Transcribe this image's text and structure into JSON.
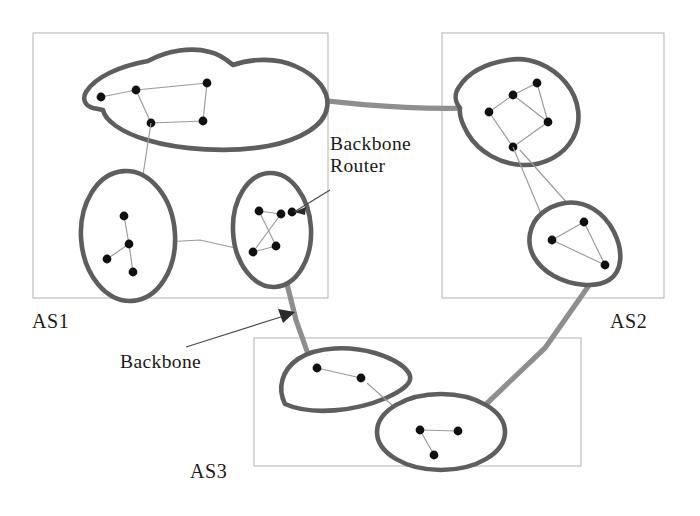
{
  "figure": {
    "background": "#ffffff",
    "width": 700,
    "height": 516
  },
  "colors": {
    "blob_outline": "#5e5e5e",
    "backbone_link": "#8e8e8e",
    "internal_link": "#9a9a9a",
    "router_node": "#101010",
    "as_box_border": "#b9b9b9",
    "leader_line": "#4a4a4a",
    "text": "#1a1a1a"
  },
  "annotations": {
    "backbone_router": {
      "line1": "Backbone",
      "line2": "Router",
      "x": 330,
      "y": 150
    },
    "backbone": {
      "text": "Backbone",
      "x": 120,
      "y": 362
    }
  },
  "autonomous_systems": [
    {
      "id": "as1",
      "label": "AS1",
      "label_x": 32,
      "label_y": 328,
      "box": {
        "x": 33,
        "y": 33,
        "width": 295,
        "height": 265
      },
      "networks": [
        {
          "id": "as1-cloud-top",
          "shape": "cloud",
          "router_count": 5,
          "routers": [
            {
              "x": 101,
              "y": 97
            },
            {
              "x": 136,
              "y": 90
            },
            {
              "x": 207,
              "y": 83
            },
            {
              "x": 151,
              "y": 123
            },
            {
              "x": 203,
              "y": 121
            }
          ],
          "edges": [
            [
              0,
              1
            ],
            [
              1,
              2
            ],
            [
              1,
              3
            ],
            [
              3,
              4
            ],
            [
              4,
              2
            ]
          ]
        },
        {
          "id": "as1-ellipse-left",
          "shape": "ellipse",
          "router_count": 4,
          "routers": [
            {
              "x": 124,
              "y": 216
            },
            {
              "x": 129,
              "y": 244
            },
            {
              "x": 107,
              "y": 259
            },
            {
              "x": 133,
              "y": 272
            }
          ],
          "edges": [
            [
              0,
              1
            ],
            [
              1,
              2
            ],
            [
              1,
              3
            ]
          ]
        },
        {
          "id": "as1-ellipse-right",
          "shape": "ellipse",
          "router_count": 4,
          "routers": [
            {
              "x": 259,
              "y": 211
            },
            {
              "x": 281,
              "y": 214
            },
            {
              "x": 292,
              "y": 212
            },
            {
              "x": 253,
              "y": 252
            },
            {
              "x": 276,
              "y": 246
            }
          ],
          "edges": [
            [
              0,
              1
            ],
            [
              0,
              4
            ],
            [
              1,
              3
            ],
            [
              3,
              4
            ]
          ]
        }
      ]
    },
    {
      "id": "as2",
      "label": "AS2",
      "label_x": 610,
      "label_y": 328,
      "box": {
        "x": 442,
        "y": 33,
        "width": 222,
        "height": 265
      },
      "networks": [
        {
          "id": "as2-blob-top",
          "shape": "blob",
          "router_count": 5,
          "routers": [
            {
              "x": 489,
              "y": 112
            },
            {
              "x": 513,
              "y": 95
            },
            {
              "x": 537,
              "y": 83
            },
            {
              "x": 548,
              "y": 122
            },
            {
              "x": 513,
              "y": 147
            }
          ],
          "edges": [
            [
              0,
              1
            ],
            [
              1,
              2
            ],
            [
              2,
              3
            ],
            [
              3,
              4
            ],
            [
              4,
              0
            ],
            [
              1,
              3
            ]
          ]
        },
        {
          "id": "as2-blob-bottom",
          "shape": "blob",
          "router_count": 3,
          "routers": [
            {
              "x": 552,
              "y": 240
            },
            {
              "x": 584,
              "y": 222
            },
            {
              "x": 605,
              "y": 265
            }
          ],
          "edges": [
            [
              0,
              1
            ],
            [
              1,
              2
            ],
            [
              0,
              2
            ]
          ]
        }
      ]
    },
    {
      "id": "as3",
      "label": "AS3",
      "label_x": 190,
      "label_y": 478,
      "box": {
        "x": 254,
        "y": 338,
        "width": 327,
        "height": 128
      },
      "networks": [
        {
          "id": "as3-fan",
          "shape": "fan",
          "router_count": 2,
          "routers": [
            {
              "x": 317,
              "y": 368
            },
            {
              "x": 361,
              "y": 378
            }
          ],
          "edges": [
            [
              0,
              1
            ]
          ]
        },
        {
          "id": "as3-ellipse",
          "shape": "ellipse",
          "router_count": 3,
          "routers": [
            {
              "x": 420,
              "y": 430
            },
            {
              "x": 458,
              "y": 431
            },
            {
              "x": 434,
              "y": 455
            }
          ],
          "edges": [
            [
              0,
              1
            ],
            [
              0,
              2
            ]
          ]
        }
      ]
    }
  ],
  "backbone_links": [
    {
      "id": "as1-to-as2",
      "from": "AS1 top cloud",
      "to": "AS2 top blob"
    },
    {
      "id": "as1-to-as3",
      "from": "AS1 right ellipse",
      "to": "AS3 fan"
    },
    {
      "id": "as2-to-as3",
      "from": "AS2 bottom blob",
      "to": "AS3 ellipse"
    }
  ],
  "inter_network_links": [
    {
      "id": "as1-cloud-to-left-ellipse"
    },
    {
      "id": "as1-left-to-right-ellipse"
    },
    {
      "id": "as2-top-to-bottom-blob"
    },
    {
      "id": "as3-fan-to-ellipse"
    }
  ]
}
